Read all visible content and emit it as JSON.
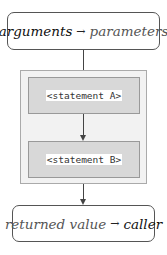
{
  "top_box": {
    "left": "arguments",
    "arrow": "→",
    "right": "parameters"
  },
  "statements": [
    {
      "label": "<statement A>"
    },
    {
      "label": "<statement B>"
    }
  ],
  "bottom_box": {
    "left": "returned value",
    "arrow": "→",
    "right": "caller"
  },
  "colors": {
    "box_border": "#555555",
    "container_bg": "#f2f2f2",
    "statement_bg": "#d8d8d8",
    "arrow": "#444444"
  }
}
